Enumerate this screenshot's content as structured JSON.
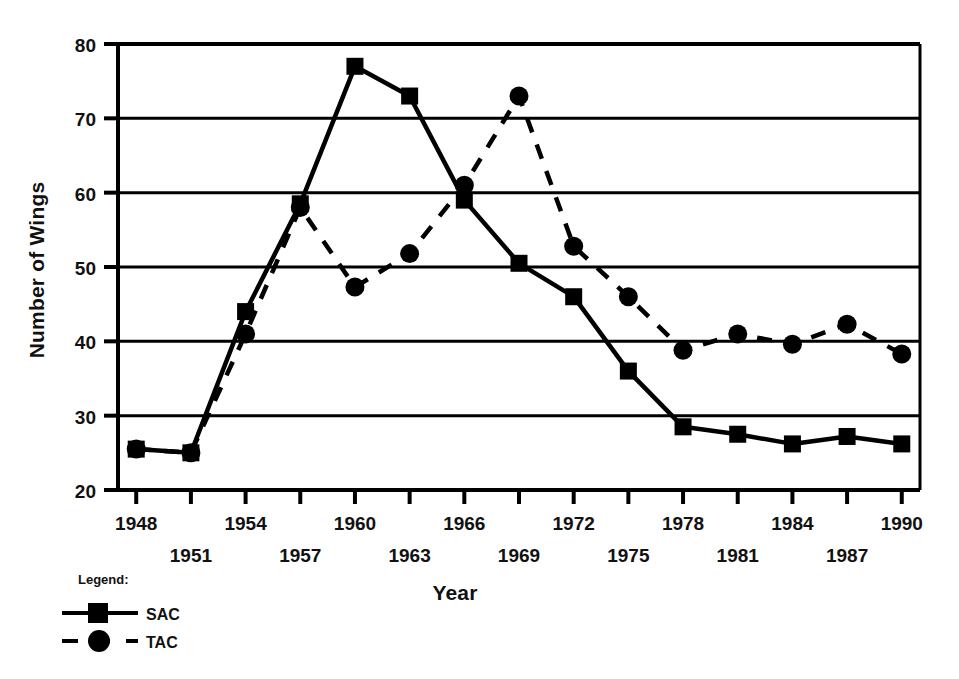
{
  "chart_data": {
    "type": "line",
    "title": "",
    "xlabel": "Year",
    "ylabel": "Number of Wings",
    "xlim": [
      1947,
      1991
    ],
    "ylim": [
      20,
      80
    ],
    "yticks": [
      20,
      30,
      40,
      50,
      60,
      70,
      80
    ],
    "xticks": [
      1948,
      1951,
      1954,
      1957,
      1960,
      1963,
      1966,
      1969,
      1972,
      1975,
      1978,
      1981,
      1984,
      1987,
      1990
    ],
    "grid": "horizontal",
    "legend_position": "below-left",
    "legend_title": "Legend:",
    "x": [
      1948,
      1951,
      1954,
      1957,
      1960,
      1963,
      1966,
      1969,
      1972,
      1975,
      1978,
      1981,
      1984,
      1987,
      1990
    ],
    "series": [
      {
        "name": "SAC",
        "marker": "square",
        "linestyle": "solid",
        "color": "#000000",
        "values": [
          25.5,
          25.0,
          44.0,
          58.5,
          77.0,
          73.0,
          59.0,
          50.5,
          46.0,
          36.0,
          28.5,
          27.5,
          26.2,
          27.2,
          26.2
        ]
      },
      {
        "name": "TAC",
        "marker": "circle",
        "linestyle": "dashed",
        "color": "#000000",
        "values": [
          25.5,
          25.0,
          41.0,
          58.0,
          47.3,
          51.8,
          61.0,
          73.0,
          52.8,
          46.0,
          38.8,
          41.0,
          39.6,
          42.3,
          38.3
        ]
      }
    ]
  },
  "axes": {
    "x_title": "Year",
    "y_title": "Number of Wings",
    "y_tick_labels": [
      "80",
      "70",
      "60",
      "50",
      "40",
      "30",
      "20"
    ],
    "x_tick_labels_top": [
      "1948",
      "1954",
      "1960",
      "1966",
      "1972",
      "1978",
      "1984",
      "1990"
    ],
    "x_tick_labels_bottom": [
      "1951",
      "1957",
      "1963",
      "1969",
      "1975",
      "1981",
      "1987"
    ]
  },
  "legend": {
    "title": "Legend:",
    "entries": [
      {
        "label": "SAC",
        "marker": "square-marker",
        "style": "solid"
      },
      {
        "label": "TAC",
        "marker": "circle-marker",
        "style": "dashed"
      }
    ]
  },
  "colors": {
    "ink": "#000000",
    "background": "#ffffff"
  }
}
